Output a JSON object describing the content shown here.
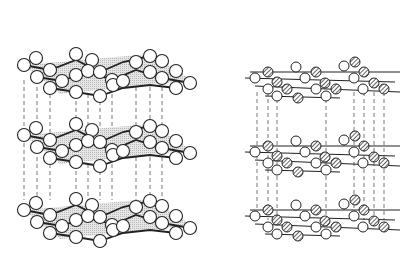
{
  "figure": {
    "colors": {
      "background": "#ffffff",
      "stroke": "#222222",
      "plane_fill": "#d8d8d8",
      "dash": "#555555",
      "open_atom": "#ffffff",
      "hatched_atom": "#9a9a9a"
    }
  },
  "left_structure": {
    "name": "graphite-structure",
    "layers_y": [
      57,
      185,
      212
    ],
    "layers": [
      {
        "dy": 0,
        "top": 50
      },
      {
        "dy": 0,
        "top": 120
      },
      {
        "dy": 0,
        "top": 195
      }
    ],
    "atom_r": 6.5,
    "atoms_rel": [
      [
        24,
        15
      ],
      [
        36,
        8
      ],
      [
        50,
        20
      ],
      [
        37,
        27
      ],
      [
        62,
        31
      ],
      [
        50,
        38
      ],
      [
        76,
        4
      ],
      [
        76,
        25
      ],
      [
        92,
        10
      ],
      [
        88,
        21
      ],
      [
        100,
        22
      ],
      [
        112,
        30
      ],
      [
        113,
        35
      ],
      [
        100,
        46
      ],
      [
        123,
        31
      ],
      [
        136,
        12
      ],
      [
        150,
        6
      ],
      [
        162,
        11
      ],
      [
        150,
        22
      ],
      [
        162,
        28
      ],
      [
        176,
        21
      ],
      [
        190,
        33
      ],
      [
        176,
        38
      ],
      [
        76,
        42
      ]
    ],
    "dash_x": [
      24,
      37,
      50,
      76,
      88,
      100,
      112,
      136,
      150,
      162
    ]
  },
  "right_structure": {
    "name": "boron-nitride-structure",
    "layers": [
      {
        "top": 62
      },
      {
        "top": 136
      },
      {
        "top": 200
      }
    ],
    "atom_r": 5,
    "atoms_rel": [
      [
        268,
        10,
        "h"
      ],
      [
        296,
        5,
        "o"
      ],
      [
        316,
        10,
        "h"
      ],
      [
        344,
        4,
        "o"
      ],
      [
        355,
        0,
        "h"
      ],
      [
        364,
        10,
        "h"
      ],
      [
        255,
        16,
        "o"
      ],
      [
        277,
        20,
        "h"
      ],
      [
        305,
        16,
        "o"
      ],
      [
        325,
        21,
        "h"
      ],
      [
        354,
        16,
        "o"
      ],
      [
        374,
        21,
        "h"
      ],
      [
        268,
        27,
        "o"
      ],
      [
        287,
        27,
        "h"
      ],
      [
        316,
        27,
        "o"
      ],
      [
        336,
        27,
        "h"
      ],
      [
        363,
        27,
        "o"
      ],
      [
        384,
        27,
        "h"
      ],
      [
        277,
        34,
        "o"
      ],
      [
        298,
        36,
        "h"
      ],
      [
        326,
        34,
        "o"
      ]
    ],
    "dash_x": [
      257,
      268,
      277,
      326,
      354,
      364,
      374,
      384
    ]
  }
}
